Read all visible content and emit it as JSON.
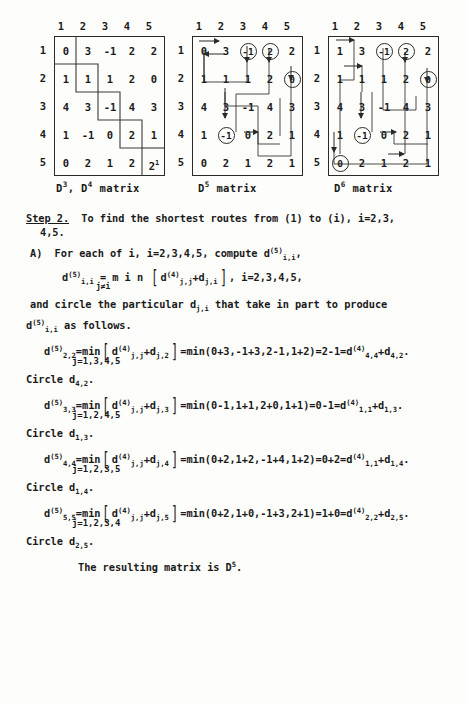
{
  "document": {
    "title": "Step 2 shortest routes matrices page",
    "final_line": "The resulting matrix is D",
    "final_line_sup": "5",
    "final_line_end": "."
  },
  "figures": [
    {
      "id": "d3-d4",
      "caption_prefix": "D",
      "caption": "D3, D4 matrix",
      "caption_parts": [
        "D",
        "3",
        ", D",
        "4",
        " matrix"
      ],
      "col_headers": [
        "1",
        "2",
        "3",
        "4",
        "5"
      ],
      "row_headers": [
        "1",
        "2",
        "3",
        "4",
        "5"
      ],
      "rows": [
        [
          "0",
          "3",
          "-1",
          "2",
          "2"
        ],
        [
          "1",
          "1",
          "1",
          "2",
          "0"
        ],
        [
          "4",
          "3",
          "-1",
          "4",
          "3"
        ],
        [
          "1",
          "-1",
          "0",
          "2",
          "1"
        ],
        [
          "0",
          "2",
          "1",
          "2",
          "2"
        ]
      ],
      "superscripts": {
        "4_4": "",
        "5_4": "1"
      },
      "circled": [],
      "note": "staircase boxes along the main diagonal"
    },
    {
      "id": "d5",
      "caption": "D5 matrix",
      "caption_parts": [
        "D",
        "5",
        " matrix"
      ],
      "col_headers": [
        "1",
        "2",
        "3",
        "4",
        "5"
      ],
      "row_headers": [
        "1",
        "2",
        "3",
        "4",
        "5"
      ],
      "rows": [
        [
          "0",
          "3",
          "-1",
          "2",
          "2"
        ],
        [
          "1",
          "1",
          "1",
          "2",
          "0"
        ],
        [
          "4",
          "3",
          "-1",
          "4",
          "3"
        ],
        [
          "1",
          "-1",
          "0",
          "2",
          "1"
        ],
        [
          "0",
          "2",
          "1",
          "2",
          "1"
        ]
      ],
      "circled": [
        "1,3",
        "1,4",
        "2,5",
        "4,2"
      ]
    },
    {
      "id": "d6",
      "caption": "D6 matrix",
      "caption_parts": [
        "D",
        "6",
        " matrix"
      ],
      "col_headers": [
        "1",
        "2",
        "3",
        "4",
        "5"
      ],
      "row_headers": [
        "1",
        "2",
        "3",
        "4",
        "5"
      ],
      "rows": [
        [
          "1",
          "3",
          "-1",
          "2",
          "2"
        ],
        [
          "1",
          "1",
          "1",
          "2",
          "0"
        ],
        [
          "4",
          "3",
          "-1",
          "4",
          "3"
        ],
        [
          "1",
          "-1",
          "0",
          "2",
          "1"
        ],
        [
          "0",
          "2",
          "1",
          "2",
          "1"
        ]
      ],
      "circled": [
        "1,3",
        "1,4",
        "2,5",
        "4,2",
        "5,1"
      ]
    }
  ],
  "text": {
    "step_label": "Step 2.",
    "step_line1": "  To find the shortest routes from (1) to (i), i=2,3,",
    "step_line2": "4,5.",
    "part_a_pre": "A)  For each of i, i=2,3,4,5, compute d",
    "part_a_sup": "(5)",
    "part_a_sub": "i,i",
    "part_a_end": ",",
    "eq_main_lhs_d": "d",
    "eq_main_lhs_sup": "(5)",
    "eq_main_lhs_sub": "i,i",
    "eq_main_eq": " = m i n ",
    "eq_main_under": "j≠i",
    "eq_main_inner_d": "d",
    "eq_main_inner_sup": "(4)",
    "eq_main_inner_sub": "j,j",
    "eq_main_inner2": "+d",
    "eq_main_inner2_sub": "j,i",
    "eq_main_tail": ", i=2,3,4,5,",
    "circle_line_pre": "and circle the particular d",
    "circle_line_sub": "j,i",
    "circle_line_post": " that take in part to produce",
    "follows_d": "d",
    "follows_sup": "(5)",
    "follows_sub": "i,i",
    "follows_text": " as follows."
  },
  "equations": [
    {
      "lhs_d": "d",
      "lhs_sup": "(5)",
      "lhs_sub": "2,2",
      "min": "=min",
      "inner_d": "d",
      "inner_sup": "(4)",
      "inner_sub": "j,j",
      "plus_d": "+d",
      "plus_sub": "j,2",
      "j_range": "j=1,3,4,5",
      "expansion": "=min(0+3,-1+3,2-1,1+2)=2-1=d",
      "result_sup": "(4)",
      "result_sub": "4,4",
      "result_plus": "+d",
      "result_plus_sub": "4,2",
      "period": ".",
      "circle_pre": "Circle d",
      "circle_sub": "4,2",
      "circle_post": "."
    },
    {
      "lhs_d": "d",
      "lhs_sup": "(5)",
      "lhs_sub": "3,3",
      "min": "=min",
      "inner_d": "d",
      "inner_sup": "(4)",
      "inner_sub": "j,j",
      "plus_d": "+d",
      "plus_sub": "j,3",
      "j_range": "j=1,2,4,5",
      "expansion": "=min(0-1,1+1,2+0,1+1)=0-1=d",
      "result_sup": "(4)",
      "result_sub": "1,1",
      "result_plus": "+d",
      "result_plus_sub": "1,3",
      "period": ".",
      "circle_pre": "Circle d",
      "circle_sub": "1,3",
      "circle_post": "."
    },
    {
      "lhs_d": "d",
      "lhs_sup": "(5)",
      "lhs_sub": "4,4",
      "min": "=min",
      "inner_d": "d",
      "inner_sup": "(4)",
      "inner_sub": "j,j",
      "plus_d": "+d",
      "plus_sub": "j,4",
      "j_range": "j=1,2,3,5",
      "expansion": "=min(0+2,1+2,-1+4,1+2)=0+2=d",
      "result_sup": "(4)",
      "result_sub": "1,1",
      "result_plus": "+d",
      "result_plus_sub": "1,4",
      "period": ".",
      "circle_pre": "Circle d",
      "circle_sub": "1,4",
      "circle_post": "."
    },
    {
      "lhs_d": "d",
      "lhs_sup": "(5)",
      "lhs_sub": "5,5",
      "min": "=min",
      "inner_d": "d",
      "inner_sup": "(4)",
      "inner_sub": "j,j",
      "plus_d": "+d",
      "plus_sub": "j,5",
      "j_range": "j=1,2,3,4",
      "expansion": "=min(0+2,1+0,-1+3,2+1)=1+0=d",
      "result_sup": "(4)",
      "result_sub": "2,2",
      "result_plus": "+d",
      "result_plus_sub": "2,5",
      "period": ".",
      "circle_pre": "Circle d",
      "circle_sub": "2,5",
      "circle_post": "."
    }
  ]
}
